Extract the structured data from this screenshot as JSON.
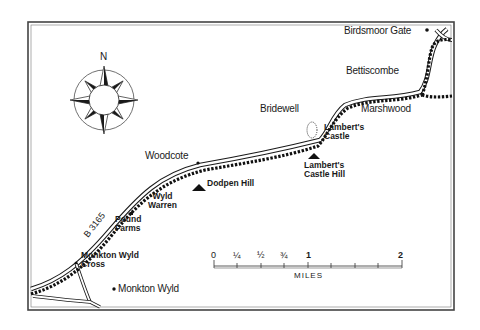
{
  "map": {
    "compass": {
      "north_label": "N"
    },
    "road_label": "B 3165",
    "places": {
      "birdsmoor_gate": "Birdsmoor Gate",
      "bettiscombe": "Bettiscombe",
      "bridewell": "Bridewell",
      "marshwood": "Marshwood",
      "woodcote": "Woodcote",
      "monkton_wyld": "Monkton Wyld"
    },
    "features": {
      "lamberts_castle": [
        "Lambert's",
        "Castle"
      ],
      "lamberts_castle_hill": [
        "Lambert's",
        "Castle Hill"
      ],
      "dodpen_hill": "Dodpen Hill",
      "wyld_warren": [
        "Wyld",
        "Warren"
      ],
      "pound_farms": [
        "Pound",
        "Farms"
      ],
      "monkton_wyld_cross": [
        "Monkton Wyld",
        "Cross"
      ]
    },
    "scale": {
      "unit_label": "MILES",
      "labels": [
        "0",
        "¼",
        "½",
        "¾",
        "1",
        "2"
      ]
    },
    "colors": {
      "ink": "#1a1a1a",
      "paper": "#ffffff",
      "frame": "#555555"
    }
  }
}
